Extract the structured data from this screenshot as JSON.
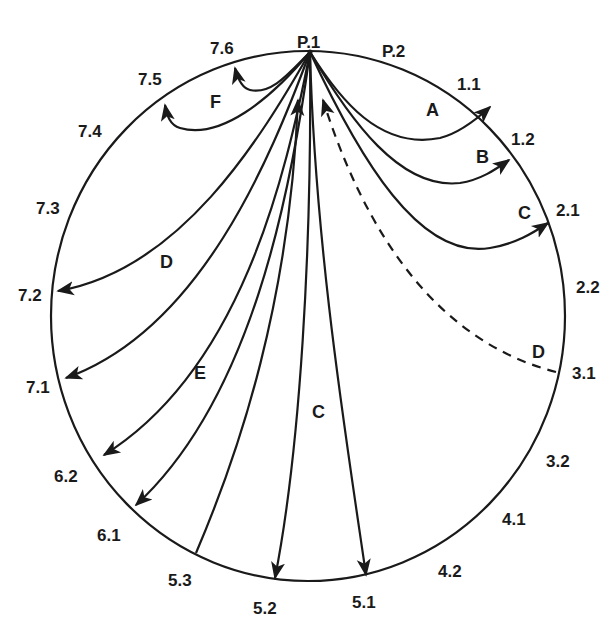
{
  "diagram": {
    "type": "circular-route-diagram",
    "hub": "P.1",
    "positions": [
      {
        "id": "p1",
        "label": "P.1",
        "x": 297,
        "y": 48
      },
      {
        "id": "p2",
        "label": "P.2",
        "x": 382,
        "y": 57
      },
      {
        "id": "1_1",
        "label": "1.1",
        "x": 457,
        "y": 90
      },
      {
        "id": "1_2",
        "label": "1.2",
        "x": 511,
        "y": 145
      },
      {
        "id": "2_1",
        "label": "2.1",
        "x": 556,
        "y": 216
      },
      {
        "id": "2_2",
        "label": "2.2",
        "x": 576,
        "y": 293
      },
      {
        "id": "3_1",
        "label": "3.1",
        "x": 572,
        "y": 379
      },
      {
        "id": "3_2",
        "label": "3.2",
        "x": 546,
        "y": 467
      },
      {
        "id": "4_1",
        "label": "4.1",
        "x": 502,
        "y": 525
      },
      {
        "id": "4_2",
        "label": "4.2",
        "x": 438,
        "y": 577
      },
      {
        "id": "5_1",
        "label": "5.1",
        "x": 352,
        "y": 608
      },
      {
        "id": "5_2",
        "label": "5.2",
        "x": 253,
        "y": 614
      },
      {
        "id": "5_3",
        "label": "5.3",
        "x": 168,
        "y": 586
      },
      {
        "id": "6_1",
        "label": "6.1",
        "x": 97,
        "y": 541
      },
      {
        "id": "6_2",
        "label": "6.2",
        "x": 54,
        "y": 482
      },
      {
        "id": "7_1",
        "label": "7.1",
        "x": 26,
        "y": 393
      },
      {
        "id": "7_2",
        "label": "7.2",
        "x": 18,
        "y": 301
      },
      {
        "id": "7_3",
        "label": "7.3",
        "x": 36,
        "y": 214
      },
      {
        "id": "7_4",
        "label": "7.4",
        "x": 78,
        "y": 137
      },
      {
        "id": "7_5",
        "label": "7.5",
        "x": 138,
        "y": 85
      },
      {
        "id": "7_6",
        "label": "7.6",
        "x": 210,
        "y": 54
      }
    ],
    "path_labels": [
      {
        "id": "A_upper",
        "label": "A",
        "x": 426,
        "y": 116
      },
      {
        "id": "B",
        "label": "B",
        "x": 476,
        "y": 163
      },
      {
        "id": "C_right",
        "label": "C",
        "x": 518,
        "y": 219
      },
      {
        "id": "D_right",
        "label": "D",
        "x": 532,
        "y": 358
      },
      {
        "id": "D_left",
        "label": "D",
        "x": 160,
        "y": 268
      },
      {
        "id": "E",
        "label": "E",
        "x": 194,
        "y": 379
      },
      {
        "id": "C_mid",
        "label": "C",
        "x": 312,
        "y": 418
      },
      {
        "id": "F",
        "label": "F",
        "x": 210,
        "y": 108
      }
    ],
    "routes": [
      {
        "id": "route-A",
        "from": "P.1",
        "to": "1.1",
        "style": "solid",
        "d": "M310,52 C340,100 380,150 440,138 C460,133 478,118 490,107"
      },
      {
        "id": "route-B",
        "from": "P.1",
        "to": "1.2",
        "style": "solid",
        "d": "M310,52 C350,120 400,190 460,183 C480,180 495,170 509,160"
      },
      {
        "id": "route-C",
        "from": "P.1",
        "to": "2.1",
        "style": "solid",
        "d": "M310,52 C360,160 420,260 490,248 C515,244 533,233 548,223"
      },
      {
        "id": "route-D-dashed",
        "from": "3.1",
        "to": "P.1",
        "style": "dashed",
        "d": "M556,372 C470,350 380,280 323,100"
      },
      {
        "id": "route-F-1",
        "from": "P.1",
        "to": "7.6",
        "style": "solid",
        "d": "M310,52 C290,72 272,95 250,90 C242,88 238,80 235,68"
      },
      {
        "id": "route-F-2",
        "from": "P.1",
        "to": "7.5",
        "style": "solid",
        "d": "M310,52 C270,100 220,140 180,128 C170,125 167,116 165,105"
      },
      {
        "id": "route-D-left",
        "from": "P.1",
        "to": "7.2",
        "style": "solid",
        "d": "M310,52 C260,140 180,270 58,291"
      },
      {
        "id": "route-7-1",
        "from": "P.1",
        "to": "7.1",
        "style": "solid",
        "d": "M310,52 C270,160 200,330 66,378"
      },
      {
        "id": "route-6-2",
        "from": "P.1",
        "to": "6.2",
        "style": "solid",
        "d": "M310,52 C285,180 240,370 104,455"
      },
      {
        "id": "route-6-1",
        "from": "P.1",
        "to": "6.1",
        "style": "solid",
        "d": "M310,52 C290,200 250,400 136,505"
      },
      {
        "id": "route-up-5-3",
        "from": "5.3",
        "to": "P.1",
        "style": "solid",
        "d": "M196,553 C240,450 290,300 298,100"
      },
      {
        "id": "route-5-2",
        "from": "P.1",
        "to": "5.2",
        "style": "solid",
        "d": "M310,52 C312,250 300,450 275,578"
      },
      {
        "id": "route-5-1",
        "from": "P.1",
        "to": "5.1",
        "style": "solid",
        "d": "M310,52 C315,250 348,450 366,575"
      }
    ],
    "colors": {
      "ink": "#1a1a1a",
      "background": "#ffffff"
    }
  }
}
